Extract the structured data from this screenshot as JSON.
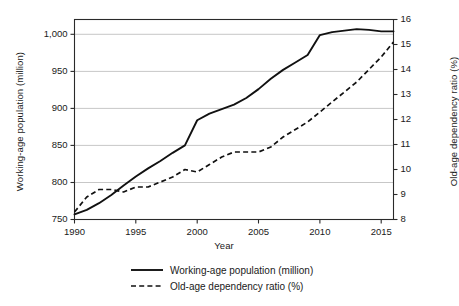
{
  "chart_data": {
    "type": "line",
    "title": "",
    "xlabel": "Year",
    "ylabel": "Working-age population  (million)",
    "y2label": "Old-age dependency ratio (%)",
    "grid": true,
    "legend_position": "bottom",
    "xlim": [
      1990,
      2016
    ],
    "ylim": [
      750,
      1020
    ],
    "y2lim": [
      8,
      16
    ],
    "xticks": [
      1990,
      1995,
      2000,
      2005,
      2010,
      2015
    ],
    "xtick_labels": [
      "1990",
      "1995",
      "2000",
      "2005",
      "2010",
      "2015"
    ],
    "yticks": [
      750,
      800,
      850,
      900,
      950,
      1000
    ],
    "ytick_labels": [
      "750",
      "800",
      "850",
      "900",
      "950",
      "1,000"
    ],
    "y2ticks": [
      8,
      9,
      10,
      11,
      12,
      13,
      14,
      15,
      16
    ],
    "y2tick_labels": [
      "8",
      "9",
      "10",
      "11",
      "12",
      "13",
      "14",
      "15",
      "16"
    ],
    "x": [
      1990,
      1991,
      1992,
      1993,
      1994,
      1995,
      1996,
      1997,
      1998,
      1999,
      2000,
      2001,
      2002,
      2003,
      2004,
      2005,
      2006,
      2007,
      2008,
      2009,
      2010,
      2011,
      2012,
      2013,
      2014,
      2015,
      2016
    ],
    "series": [
      {
        "name": "Working-age population (million)",
        "axis": "left",
        "style": "solid",
        "color": "#111111",
        "units": "million",
        "values": [
          757,
          763,
          772,
          783,
          796,
          808,
          819,
          829,
          840,
          850,
          884,
          893,
          899,
          905,
          914,
          926,
          940,
          952,
          962,
          972,
          999,
          1003,
          1005,
          1007,
          1006,
          1004,
          1004
        ]
      },
      {
        "name": "Old-age dependency ratio (%)",
        "axis": "right",
        "style": "dashed",
        "color": "#111111",
        "units": "%",
        "values": [
          8.3,
          8.9,
          9.2,
          9.2,
          9.1,
          9.3,
          9.3,
          9.5,
          9.7,
          10.0,
          9.9,
          10.2,
          10.5,
          10.7,
          10.7,
          10.7,
          10.9,
          11.3,
          11.6,
          11.9,
          12.3,
          12.7,
          13.1,
          13.5,
          14.0,
          14.5,
          15.1
        ]
      }
    ]
  },
  "legend": {
    "items": [
      {
        "label": "Working-age population (million)",
        "style": "solid"
      },
      {
        "label": "Old-age dependency ratio (%)",
        "style": "dashed"
      }
    ]
  }
}
